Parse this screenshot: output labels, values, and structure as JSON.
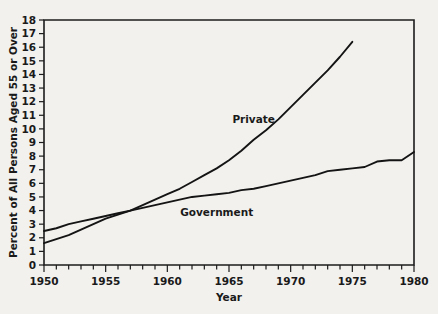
{
  "chart_data": {
    "type": "line",
    "title": "",
    "xlabel": "Year",
    "ylabel": "Percent of All Persons Aged 55 or Over",
    "xlim": [
      1950,
      1980
    ],
    "ylim": [
      0,
      18
    ],
    "xticks": [
      1950,
      1955,
      1960,
      1965,
      1970,
      1975,
      1980
    ],
    "xtick_labels": [
      "1950",
      "1955",
      "1960",
      "1965",
      "1970",
      "1975",
      "1980"
    ],
    "xtick_minor_step": 1,
    "yticks": [
      0,
      1,
      2,
      3,
      4,
      5,
      6,
      7,
      8,
      9,
      10,
      11,
      12,
      13,
      14,
      15,
      16,
      17,
      18
    ],
    "ytick_labels": [
      "0",
      "1",
      "2",
      "3",
      "4",
      "5",
      "6",
      "7",
      "8",
      "9",
      "10",
      "11",
      "12",
      "13",
      "14",
      "15",
      "16",
      "17",
      "18"
    ],
    "grid": false,
    "legend_position": "inline-annotations",
    "line_color": "#141414",
    "background_color": "#f2f1ee",
    "series": [
      {
        "name": "Private",
        "label": "Private",
        "label_x": 1967.0,
        "label_y": 10.4,
        "x": [
          1950,
          1951,
          1952,
          1953,
          1954,
          1955,
          1956,
          1957,
          1958,
          1959,
          1960,
          1961,
          1962,
          1963,
          1964,
          1965,
          1966,
          1967,
          1968,
          1969,
          1970,
          1971,
          1972,
          1973,
          1974,
          1975
        ],
        "values": [
          1.6,
          1.9,
          2.2,
          2.6,
          3.0,
          3.4,
          3.7,
          4.0,
          4.4,
          4.8,
          5.2,
          5.6,
          6.1,
          6.6,
          7.1,
          7.7,
          8.4,
          9.2,
          9.9,
          10.7,
          11.6,
          12.5,
          13.4,
          14.3,
          15.3,
          16.4
        ]
      },
      {
        "name": "Government",
        "label": "Government",
        "label_x": 1964.0,
        "label_y": 3.6,
        "x": [
          1950,
          1951,
          1952,
          1953,
          1954,
          1955,
          1956,
          1957,
          1958,
          1959,
          1960,
          1961,
          1962,
          1963,
          1964,
          1965,
          1966,
          1967,
          1968,
          1969,
          1970,
          1971,
          1972,
          1973,
          1974,
          1975,
          1976,
          1977,
          1978,
          1979,
          1980
        ],
        "values": [
          2.5,
          2.7,
          3.0,
          3.2,
          3.4,
          3.6,
          3.8,
          4.0,
          4.2,
          4.4,
          4.6,
          4.8,
          5.0,
          5.1,
          5.2,
          5.3,
          5.5,
          5.6,
          5.8,
          6.0,
          6.2,
          6.4,
          6.6,
          6.9,
          7.0,
          7.1,
          7.2,
          7.6,
          7.7,
          7.7,
          8.3
        ]
      }
    ]
  },
  "axes_geometry": {
    "plot_left_px": 44,
    "plot_right_px": 414,
    "plot_top_px": 20,
    "plot_bottom_px": 265
  }
}
